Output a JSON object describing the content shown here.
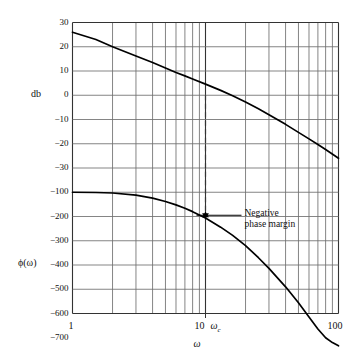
{
  "figure": {
    "type": "bode-plot",
    "background": "#ffffff",
    "curve_color": "#000000",
    "grid_color": "#6f6f6f",
    "axis_color": "#333333"
  },
  "axes": {
    "x": {
      "label": "ω",
      "scale": "log",
      "min": 1,
      "max": 100,
      "tick_labels": [
        "1",
        "10",
        "100"
      ],
      "tick_values": [
        1,
        10,
        100
      ],
      "cutoff_label": "ω",
      "cutoff_sub": "c",
      "cutoff_value": 10,
      "minor_decades": [
        2,
        3,
        4,
        5,
        6,
        7,
        8,
        9
      ]
    },
    "y_upper": {
      "label": "db",
      "tick_labels": [
        "30",
        "20",
        "10",
        "0",
        "−10",
        "−20",
        "−30"
      ],
      "tick_values": [
        30,
        20,
        10,
        0,
        -10,
        -20,
        -30
      ],
      "min": -40,
      "max": 30
    },
    "y_lower": {
      "label": "ϕ(ω)",
      "tick_labels": [
        "−100",
        "−200",
        "−300",
        "−400",
        "−500",
        "−600",
        "−700"
      ],
      "tick_values": [
        -100,
        -200,
        -300,
        -400,
        -500,
        -600,
        -700
      ],
      "min": -800,
      "max": -100
    }
  },
  "annotation": {
    "line1": "Negative",
    "line2": "phase margin",
    "marker": "double-arrow"
  },
  "chart_data": {
    "type": "line",
    "title": "",
    "xlabel": "ω",
    "ylabel": "db / ϕ(ω)",
    "xscale": "log",
    "xlim": [
      1,
      100
    ],
    "grid": true,
    "legend": "none",
    "series": [
      {
        "name": "magnitude_db",
        "axis": "y_upper",
        "ylim": [
          -40,
          30
        ],
        "x": [
          1,
          1.5,
          2,
          3,
          4,
          5,
          6,
          7,
          8,
          10,
          13,
          16,
          20,
          25,
          30,
          40,
          50,
          60,
          70,
          80,
          100
        ],
        "values": [
          26.0,
          23.0,
          20.0,
          16.2,
          13.5,
          11.2,
          9.4,
          8.0,
          6.7,
          4.6,
          2.0,
          -0.2,
          -2.8,
          -5.6,
          -8.0,
          -12.0,
          -15.3,
          -18.0,
          -20.3,
          -22.4,
          -26.0
        ]
      },
      {
        "name": "phase_deg",
        "axis": "y_lower",
        "ylim": [
          -800,
          -100
        ],
        "x": [
          1,
          1.5,
          2,
          3,
          4,
          5,
          6,
          7,
          8,
          10,
          13,
          16,
          20,
          25,
          30,
          40,
          50,
          60,
          70,
          80,
          90,
          100
        ],
        "values": [
          -100,
          -101,
          -103,
          -112,
          -124,
          -138,
          -152,
          -166,
          -180,
          -206,
          -244,
          -278,
          -320,
          -370,
          -414,
          -490,
          -556,
          -614,
          -664,
          -700,
          -720,
          -733
        ]
      }
    ],
    "annotations": [
      {
        "text": "Negative phase margin",
        "at_x": 10,
        "from_deg": -180,
        "to_deg": -206,
        "marker": "double-headed-arrow",
        "dashed_guide_from_db": 0
      }
    ]
  }
}
